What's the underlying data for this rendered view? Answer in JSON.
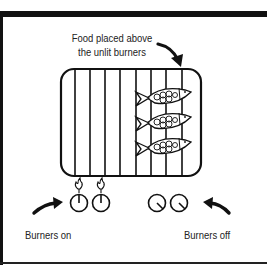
{
  "diagram": {
    "caption_food": {
      "line1": "Food placed above",
      "line2": "the unlit burners"
    },
    "label_left": "Burners on",
    "label_right": "Burners off",
    "grill": {
      "grates": 8,
      "food_items": 3,
      "food_icon": "fish-icon"
    },
    "burners_on": {
      "count": 2,
      "state": "lit",
      "icon": "flame-icon"
    },
    "burners_off": {
      "count": 2,
      "state": "off"
    },
    "colors": {
      "ink": "#111111",
      "paper": "#ffffff"
    }
  }
}
